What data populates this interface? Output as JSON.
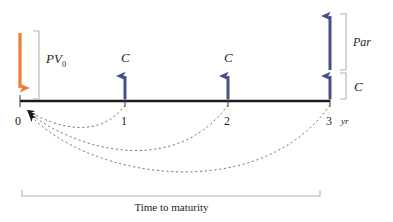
{
  "diagram": {
    "colors": {
      "outflow_arrow": "#ED7D31",
      "inflow_arrow": "#48508C",
      "timeline": "#1a1a1a",
      "bracket": "#b5b2a8",
      "dashed_arc": "#6b6b6b",
      "text": "#1d1d1d",
      "background": "#ffffff"
    },
    "timeline": {
      "axis_label": "Time to maturity",
      "unit": "yr",
      "tick_labels": [
        "0",
        "1",
        "2",
        "3"
      ],
      "tick_positions_px": [
        20,
        125,
        228,
        330
      ],
      "axis_y_px": 101
    },
    "flows": [
      {
        "period": "0",
        "label": "PV",
        "subscript": "0",
        "direction": "down",
        "kind": "outflow",
        "bracket_label": "PV0"
      },
      {
        "period": "1",
        "label": "C",
        "direction": "up",
        "kind": "coupon"
      },
      {
        "period": "2",
        "label": "C",
        "direction": "up",
        "kind": "coupon"
      },
      {
        "period": "3",
        "label": "C",
        "direction": "up",
        "kind": "coupon",
        "bracket_label": "C"
      },
      {
        "period": "3",
        "label": "Par",
        "direction": "up",
        "kind": "principal",
        "bracket_label": "Par"
      }
    ],
    "brackets": {
      "pv_label": "PV",
      "pv_subscript": "0",
      "par_label": "Par",
      "coupon_label": "C"
    },
    "discount_arcs": {
      "count": 3,
      "from_periods": [
        "1",
        "2",
        "3"
      ],
      "to_period": "0",
      "style": "dashed"
    }
  }
}
